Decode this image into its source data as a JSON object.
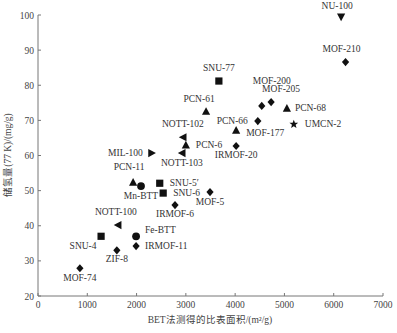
{
  "chart_data": {
    "type": "scatter",
    "title": "",
    "xlabel": "BET法测得的比表面积/(m²/g)",
    "ylabel": "储氢量(77 K)/(mg/g)",
    "xlim": [
      0,
      7000
    ],
    "ylim": [
      20,
      100
    ],
    "xticks": [
      0,
      1000,
      2000,
      3000,
      4000,
      5000,
      6000,
      7000
    ],
    "yticks": [
      20,
      30,
      40,
      50,
      60,
      70,
      80,
      90,
      100
    ],
    "grid": false,
    "legend": null,
    "points": [
      {
        "name": "NU-100",
        "x": 6150,
        "y": 99.4,
        "marker": "triangle-down",
        "label_dx": -4,
        "label_dy": -8,
        "anchor": "middle"
      },
      {
        "name": "MOF-210",
        "x": 6240,
        "y": 86.6,
        "marker": "diamond",
        "label_dx": -4,
        "label_dy": -10,
        "anchor": "middle"
      },
      {
        "name": "SNU-77",
        "x": 3670,
        "y": 81.2,
        "marker": "square",
        "label_dx": 0,
        "label_dy": -10,
        "anchor": "middle"
      },
      {
        "name": "MOF-200",
        "x": 4540,
        "y": 74.1,
        "marker": "diamond",
        "label_dx": 10,
        "label_dy": -22,
        "anchor": "middle"
      },
      {
        "name": "MOF-205",
        "x": 4730,
        "y": 75.2,
        "marker": "diamond",
        "label_dx": 10,
        "label_dy": -10,
        "anchor": "middle"
      },
      {
        "name": "PCN-68",
        "x": 5050,
        "y": 73.5,
        "marker": "triangle-up",
        "label_dx": 4,
        "label_dy": 3,
        "anchor": "start"
      },
      {
        "name": "PCN-61",
        "x": 3410,
        "y": 72.6,
        "marker": "triangle-up",
        "label_dx": -7,
        "label_dy": -9,
        "anchor": "middle"
      },
      {
        "name": "PCN-66",
        "x": 4460,
        "y": 69.8,
        "marker": "diamond",
        "label_dx": -6,
        "label_dy": 3,
        "anchor": "end"
      },
      {
        "name": "UMCN-2",
        "x": 5190,
        "y": 68.9,
        "marker": "star",
        "label_dx": 7,
        "label_dy": 3,
        "anchor": "start"
      },
      {
        "name": "MOF-177",
        "x": 4020,
        "y": 67.2,
        "marker": "triangle-up",
        "label_dx": 6,
        "label_dy": 6,
        "anchor": "start"
      },
      {
        "name": "NOTT-102",
        "x": 2940,
        "y": 65.2,
        "marker": "triangle-left",
        "label_dx": 0,
        "label_dy": -10,
        "anchor": "middle"
      },
      {
        "name": "PCN-6",
        "x": 3000,
        "y": 63.0,
        "marker": "triangle-up",
        "label_dx": 6,
        "label_dy": 3,
        "anchor": "start"
      },
      {
        "name": "IRMOF-20",
        "x": 4020,
        "y": 62.7,
        "marker": "diamond",
        "label_dx": 0,
        "label_dy": 12,
        "anchor": "middle"
      },
      {
        "name": "NOTT-103",
        "x": 2920,
        "y": 60.7,
        "marker": "triangle-left",
        "label_dx": 0,
        "label_dy": 13,
        "anchor": "middle"
      },
      {
        "name": "MIL-100",
        "x": 2310,
        "y": 60.7,
        "marker": "triangle-right",
        "label_dx": -5,
        "label_dy": 3,
        "anchor": "end"
      },
      {
        "name": "PCN-11",
        "x": 1930,
        "y": 52.4,
        "marker": "triangle-up",
        "label_dx": -4,
        "label_dy": -12,
        "anchor": "middle"
      },
      {
        "name": "Mn-BTT",
        "x": 2090,
        "y": 51.3,
        "marker": "circle",
        "label_dx": 0,
        "label_dy": 13,
        "anchor": "middle"
      },
      {
        "name": "SNU-5′",
        "x": 2470,
        "y": 52.1,
        "marker": "square",
        "label_dx": 6,
        "label_dy": 3,
        "anchor": "start"
      },
      {
        "name": "SNU-6",
        "x": 2540,
        "y": 49.3,
        "marker": "square",
        "label_dx": 6,
        "label_dy": 3,
        "anchor": "start"
      },
      {
        "name": "MOF-5",
        "x": 3490,
        "y": 49.6,
        "marker": "diamond",
        "label_dx": 0,
        "label_dy": 13,
        "anchor": "middle"
      },
      {
        "name": "IRMOF-6",
        "x": 2780,
        "y": 45.9,
        "marker": "diamond",
        "label_dx": 0,
        "label_dy": 12,
        "anchor": "middle"
      },
      {
        "name": "NOTT-100",
        "x": 1620,
        "y": 40.2,
        "marker": "triangle-left",
        "label_dx": -2,
        "label_dy": -10,
        "anchor": "middle"
      },
      {
        "name": "SNU-4",
        "x": 1280,
        "y": 37.0,
        "marker": "square",
        "label_dx": -18,
        "label_dy": 13,
        "anchor": "middle"
      },
      {
        "name": "Fe-BTT",
        "x": 1990,
        "y": 37.0,
        "marker": "circle",
        "label_dx": 5,
        "label_dy": -3,
        "anchor": "start"
      },
      {
        "name": "IRMOF-11",
        "x": 1990,
        "y": 34.2,
        "marker": "diamond",
        "label_dx": 5,
        "label_dy": 3,
        "anchor": "start"
      },
      {
        "name": "ZIF-8",
        "x": 1600,
        "y": 33.0,
        "marker": "diamond",
        "label_dx": 0,
        "label_dy": 12,
        "anchor": "middle"
      },
      {
        "name": "MOF-74",
        "x": 850,
        "y": 27.9,
        "marker": "diamond",
        "label_dx": 0,
        "label_dy": 13,
        "anchor": "middle"
      }
    ]
  },
  "colors": {
    "axis": "#777777",
    "marker": "#111111",
    "text": "#333333"
  }
}
